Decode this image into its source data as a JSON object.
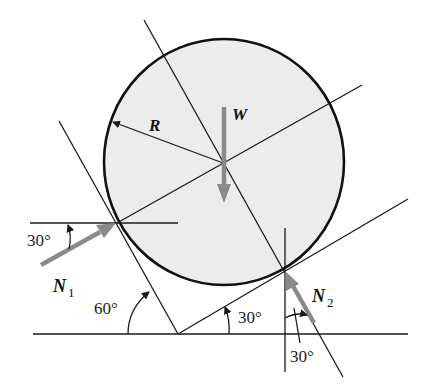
{
  "diagram": {
    "title": "",
    "labels": {
      "radius": "R",
      "weight": "W",
      "normal1": "N",
      "normal1_sub": "1",
      "normal2": "N",
      "normal2_sub": "2",
      "angle_n1": "30°",
      "angle_left_wall": "60°",
      "angle_right_wall": "30°",
      "angle_n2": "30°"
    },
    "colors": {
      "force_arrow": "#8a8a8a",
      "circle_fill": "#ececec",
      "line": "#1a1a1a"
    }
  }
}
